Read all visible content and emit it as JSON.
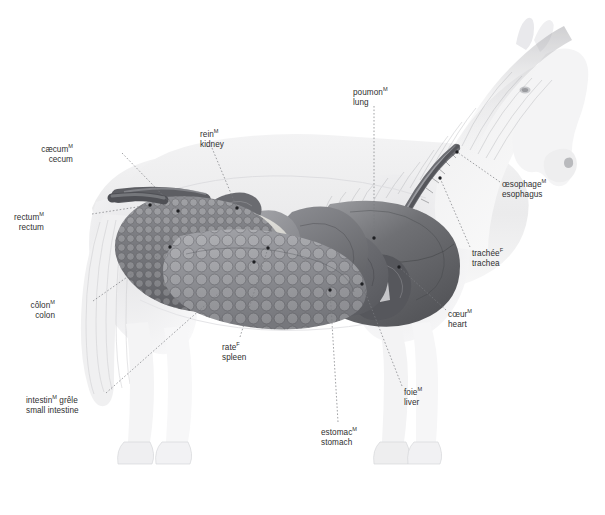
{
  "figure": {
    "background_color": "#ffffff",
    "label_color": "#2f2f2f",
    "width": 605,
    "height": 515
  },
  "labels": [
    {
      "id": "cecum",
      "fr": "cæcum",
      "gender": "M",
      "en": "cecum",
      "x": 73,
      "y": 141,
      "align": "right",
      "leader": [
        [
          122,
          153
        ],
        [
          178,
          211
        ]
      ],
      "dot": [
        178,
        211
      ]
    },
    {
      "id": "rectum",
      "fr": "rectum",
      "gender": "M",
      "en": "rectum",
      "x": 44,
      "y": 209,
      "align": "right",
      "leader": [
        [
          92,
          214
        ],
        [
          150,
          205
        ]
      ],
      "dot": [
        150,
        205
      ]
    },
    {
      "id": "colon",
      "fr": "côlon",
      "gender": "M",
      "en": "colon",
      "x": 55,
      "y": 297,
      "align": "right",
      "leader": [
        [
          93,
          301
        ],
        [
          170,
          247
        ]
      ],
      "dot": [
        170,
        247
      ]
    },
    {
      "id": "small-intestine",
      "fr": "intestin",
      "gender": "M",
      "fr2": "grêle",
      "en": "small intestine",
      "x": 26,
      "y": 392,
      "align": "left",
      "leader": [
        [
          106,
          393
        ],
        [
          254,
          262
        ]
      ],
      "dot": [
        254,
        262
      ]
    },
    {
      "id": "kidney",
      "fr": "rein",
      "gender": "M",
      "en": "kidney",
      "x": 200,
      "y": 126,
      "align": "left",
      "leader": [
        [
          212,
          148
        ],
        [
          237,
          208
        ]
      ],
      "dot": [
        237,
        208
      ]
    },
    {
      "id": "lung",
      "fr": "poumon",
      "gender": "M",
      "en": "lung",
      "x": 353,
      "y": 84,
      "align": "left",
      "leader": [
        [
          374,
          106
        ],
        [
          374,
          238
        ]
      ],
      "dot": [
        374,
        238
      ]
    },
    {
      "id": "esophagus",
      "fr": "œsophage",
      "gender": "M",
      "en": "esophagus",
      "x": 502,
      "y": 176,
      "align": "left",
      "leader": [
        [
          500,
          182
        ],
        [
          457,
          152
        ]
      ],
      "dot": [
        457,
        152
      ]
    },
    {
      "id": "trachea",
      "fr": "trachée",
      "gender": "F",
      "en": "trachea",
      "x": 472,
      "y": 245,
      "align": "left",
      "leader": [
        [
          470,
          247
        ],
        [
          440,
          178
        ]
      ],
      "dot": [
        440,
        178
      ]
    },
    {
      "id": "heart",
      "fr": "cœur",
      "gender": "M",
      "en": "heart",
      "x": 448,
      "y": 306,
      "align": "left",
      "leader": [
        [
          446,
          310
        ],
        [
          399,
          267
        ]
      ],
      "dot": [
        399,
        267
      ]
    },
    {
      "id": "spleen",
      "fr": "rate",
      "gender": "F",
      "en": "spleen",
      "x": 222,
      "y": 339,
      "align": "left",
      "leader": [
        [
          240,
          337
        ],
        [
          268,
          248
        ]
      ],
      "dot": [
        268,
        248
      ]
    },
    {
      "id": "liver",
      "fr": "foie",
      "gender": "M",
      "en": "liver",
      "x": 404,
      "y": 384,
      "align": "left",
      "leader": [
        [
          402,
          386
        ],
        [
          362,
          284
        ]
      ],
      "dot": [
        362,
        284
      ]
    },
    {
      "id": "stomach",
      "fr": "estomac",
      "gender": "M",
      "en": "stomach",
      "x": 321,
      "y": 424,
      "align": "left",
      "leader": [
        [
          338,
          422
        ],
        [
          330,
          290
        ]
      ],
      "dot": [
        330,
        290
      ]
    }
  ]
}
